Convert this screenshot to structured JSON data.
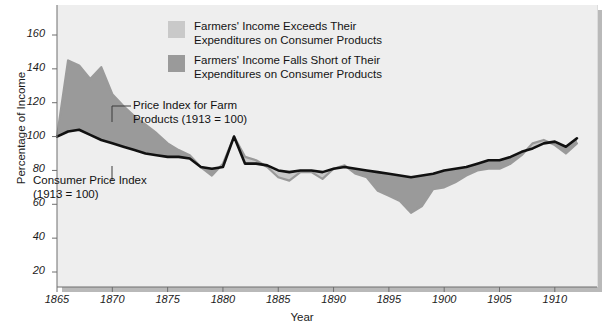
{
  "chart_data": {
    "type": "area",
    "title": "",
    "xlabel": "Year",
    "ylabel": "Percentage of Income",
    "xlim": [
      1865,
      1913
    ],
    "ylim": [
      10,
      168
    ],
    "grid": false,
    "legend_position": "top-center",
    "x": [
      1865,
      1866,
      1867,
      1868,
      1869,
      1870,
      1871,
      1872,
      1873,
      1874,
      1875,
      1876,
      1877,
      1878,
      1879,
      1880,
      1881,
      1882,
      1883,
      1884,
      1885,
      1886,
      1887,
      1888,
      1889,
      1890,
      1891,
      1892,
      1893,
      1894,
      1895,
      1896,
      1897,
      1898,
      1899,
      1900,
      1901,
      1902,
      1903,
      1904,
      1905,
      1906,
      1907,
      1908,
      1909,
      1910,
      1911,
      1912
    ],
    "series": [
      {
        "name": "Price Index for Farm Products (1913 = 100)",
        "color": "#9a9a9a",
        "values": [
          100,
          145,
          142,
          134,
          141,
          125,
          118,
          112,
          107,
          102,
          96,
          92,
          89,
          82,
          77,
          84,
          100,
          88,
          86,
          82,
          76,
          74,
          79,
          79,
          75,
          81,
          83,
          78,
          76,
          68,
          65,
          62,
          55,
          59,
          69,
          70,
          73,
          77,
          80,
          81,
          81,
          84,
          89,
          96,
          98,
          95,
          90,
          96
        ]
      },
      {
        "name": "Consumer Price Index (1913 = 100)",
        "color": "#111111",
        "values": [
          100,
          103,
          104,
          101,
          98,
          96,
          94,
          92,
          90,
          89,
          88,
          88,
          87,
          82,
          81,
          82,
          100,
          84,
          84,
          83,
          80,
          79,
          80,
          80,
          79,
          81,
          82,
          81,
          80,
          79,
          78,
          77,
          76,
          77,
          78,
          80,
          81,
          82,
          84,
          86,
          86,
          88,
          91,
          93,
          96,
          97,
          94,
          99
        ]
      }
    ],
    "fills": [
      {
        "name": "Farmers' Income Exceeds Their Expenditures on Consumer Products",
        "color": "#c9c9c9",
        "meaning": "farm price index above consumer price index"
      },
      {
        "name": "Farmers' Income Falls Short of Their Expenditures on Consumer Products",
        "color": "#9a9a9a",
        "meaning": "farm price index below consumer price index"
      }
    ],
    "yticks": [
      20,
      40,
      60,
      80,
      100,
      120,
      140,
      160
    ],
    "xticks": [
      1865,
      1870,
      1875,
      1880,
      1885,
      1890,
      1895,
      1900,
      1905,
      1910
    ],
    "annotations": [
      {
        "id": "farm",
        "lines": [
          "Price Index for Farm",
          "Products (1913 = 100)"
        ]
      },
      {
        "id": "cpi",
        "lines": [
          "Consumer Price Index",
          "(1913 = 100)"
        ]
      }
    ]
  },
  "legend": {
    "items": [
      {
        "color": "#c9c9c9",
        "line1": "Farmers' Income Exceeds Their",
        "line2": "Expenditures on Consumer Products"
      },
      {
        "color": "#9a9a9a",
        "line1": "Farmers' Income Falls Short of Their",
        "line2": "Expenditures on Consumer Products"
      }
    ]
  },
  "annotations": {
    "farm": {
      "line1": "Price Index for Farm",
      "line2": "Products (1913 = 100)"
    },
    "cpi": {
      "line1": "Consumer Price Index",
      "line2": "(1913 = 100)"
    }
  },
  "axes": {
    "ylabel": "Percentage of Income",
    "xlabel": "Year",
    "yticks": [
      "160",
      "140",
      "120",
      "100",
      "80",
      "60",
      "40",
      "20"
    ],
    "xticks": [
      "1865",
      "1870",
      "1875",
      "1880",
      "1885",
      "1890",
      "1895",
      "1900",
      "1905",
      "1910"
    ]
  }
}
